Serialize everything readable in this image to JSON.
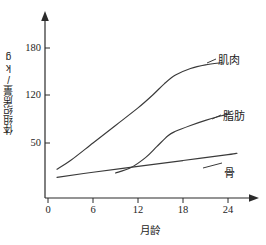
{
  "chart_data": {
    "type": "line",
    "title": "",
    "xlabel": "月龄",
    "ylabel": "体组织质量/kg",
    "xticks": [
      "0",
      "6",
      "12",
      "18",
      "24"
    ],
    "xtick_values": [
      0,
      6,
      12,
      18,
      24
    ],
    "yticks": [
      "50",
      "120",
      "180"
    ],
    "ytick_values": [
      50,
      120,
      180
    ],
    "xlim": [
      0,
      27
    ],
    "ylim": [
      0,
      200
    ],
    "grid": false,
    "legend_position": "inline-right",
    "series": [
      {
        "name": "肌肉",
        "label": "肌肉",
        "x": [
          1.2,
          3,
          6,
          9,
          12,
          14,
          15.5,
          17,
          19,
          21,
          23.2
        ],
        "values": [
          14,
          26,
          50,
          74,
          98,
          116,
          131,
          143,
          152,
          157,
          160
        ]
      },
      {
        "name": "脂肪",
        "label": "脂肪",
        "x": [
          9,
          11,
          13,
          14.5,
          16,
          17,
          19,
          21,
          23,
          24.3
        ],
        "values": [
          9,
          16,
          30,
          45,
          60,
          66,
          74,
          81,
          87,
          90
        ]
      },
      {
        "name": "骨",
        "label": "骨",
        "x": [
          1.2,
          6,
          12,
          18,
          24,
          25.2
        ],
        "values": [
          3,
          10,
          18,
          26,
          34,
          36
        ]
      }
    ]
  },
  "axis": {
    "x_arrow": "arrow-right-icon",
    "y_arrow": "arrow-up-icon"
  }
}
